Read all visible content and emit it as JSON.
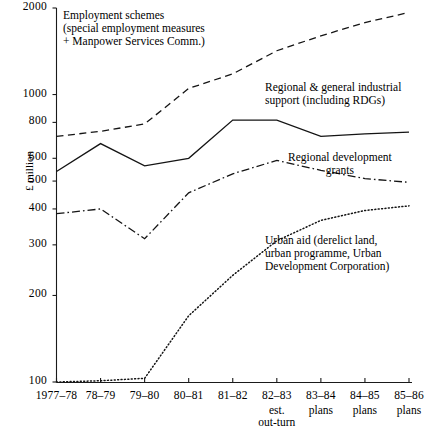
{
  "chart_data": {
    "type": "line",
    "title": "",
    "xlabel": "",
    "ylabel": "£ million",
    "yscale": "log",
    "ylim": [
      100,
      2000
    ],
    "grid": false,
    "legend_position": "inline-annotations",
    "categories": [
      "1977–78",
      "78–79",
      "79–80",
      "80–81",
      "81–82",
      "82–83",
      "83–84",
      "84–85",
      "85–86"
    ],
    "category_sublabels": [
      "",
      "",
      "",
      "",
      "",
      "est.\nout-turn",
      "plans",
      "plans",
      "plans"
    ],
    "ytick_labels": [
      "2000",
      "1000",
      "800",
      "600",
      "500",
      "400",
      "300",
      "200",
      "100"
    ],
    "ytick_values": [
      2000,
      1000,
      800,
      600,
      500,
      400,
      300,
      200,
      100
    ],
    "series": [
      {
        "name": "Employment schemes (special employment measures + Manpower Services Comm.)",
        "style": "dashed",
        "values": [
          715,
          745,
          790,
          1050,
          1180,
          1420,
          1600,
          1780,
          1930
        ]
      },
      {
        "name": "Regional & general industrial support (including RDGs)",
        "style": "solid",
        "values": [
          540,
          675,
          565,
          600,
          815,
          815,
          715,
          730,
          740
        ]
      },
      {
        "name": "Regional development grants",
        "style": "dash-dot",
        "values": [
          385,
          400,
          315,
          455,
          530,
          590,
          545,
          510,
          495
        ]
      },
      {
        "name": "Urban aid (derelict land, urban programme, Urban Development Corporation)",
        "style": "dotted",
        "values": [
          100,
          101,
          103,
          170,
          235,
          310,
          365,
          395,
          410
        ]
      }
    ]
  },
  "annotations": [
    {
      "id": "employment-schemes",
      "lines": [
        "Employment schemes",
        "(special employment measures",
        "+ Manpower Services Comm.)"
      ],
      "series_ref": "Employment schemes (special employment measures + Manpower Services Comm.)"
    },
    {
      "id": "regional-general-industrial-support",
      "lines": [
        "Regional & general industrial",
        "support (including RDGs)"
      ],
      "series_ref": "Regional & general industrial support (including RDGs)"
    },
    {
      "id": "regional-development-grants",
      "lines": [
        "Regional development",
        "grants"
      ],
      "series_ref": "Regional development grants"
    },
    {
      "id": "urban-aid",
      "lines": [
        "Urban aid (derelict land,",
        "urban programme, Urban",
        "Development Corporation)"
      ],
      "series_ref": "Urban aid (derelict land, urban programme, Urban Development Corporation)"
    }
  ],
  "axis": {
    "y_title": "£ million"
  }
}
